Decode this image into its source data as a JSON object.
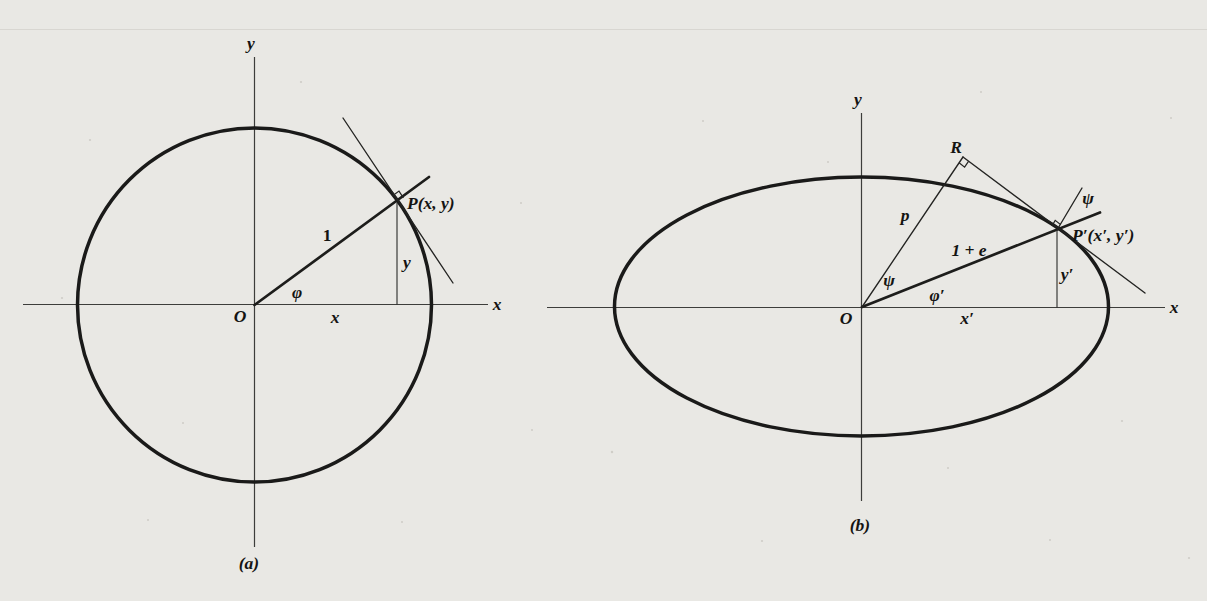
{
  "page": {
    "colors": {
      "paper": "#e9e8e4",
      "ink": "#1a1a19",
      "axis": "#3d3d3b",
      "faint_rule": "#d8d6d1"
    }
  },
  "figure_a": {
    "caption": "(a)",
    "labels": {
      "axis_y": "y",
      "axis_x": "x",
      "origin": "O",
      "radius": "1",
      "angle_phi": "φ",
      "seg_x": "x",
      "seg_y": "y",
      "point": "P(x, y)"
    }
  },
  "figure_b": {
    "caption": "(b)",
    "labels": {
      "axis_y": "y",
      "axis_x": "x",
      "origin": "O",
      "foot": "R",
      "seg_p": "p",
      "radius": "1 + e",
      "psi_at_origin": "ψ",
      "angle_phi": "φ′",
      "seg_x": "x′",
      "seg_y": "y′",
      "psi_at_point": "ψ",
      "point": "P′(x′, y′)"
    }
  }
}
